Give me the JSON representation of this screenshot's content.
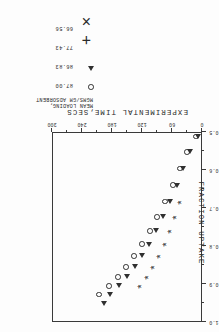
{
  "chart_data": {
    "type": "scatter",
    "title": "",
    "xlabel": "EXPERIMENTAL TIME,SECS",
    "ylabel": "FRACTION UPTAKE",
    "xlim": [
      0,
      300
    ],
    "ylim": [
      0.5,
      1.0
    ],
    "xticks": [
      "0",
      "60",
      "120",
      "180",
      "240",
      "300"
    ],
    "yticks": [
      "0.5",
      "0.6",
      "0.7",
      "0.8",
      "0.9",
      "1.0"
    ],
    "grid": false,
    "legend_position": "outside-right",
    "legend_title_line1": "MEAN LOADING,",
    "legend_title_line2": "MGMS/GM ADSORBENT",
    "series": [
      {
        "name": "87.00",
        "marker": "circle",
        "points": [
          {
            "x": 12,
            "y": 0.512
          },
          {
            "x": 30,
            "y": 0.552
          },
          {
            "x": 44,
            "y": 0.596
          },
          {
            "x": 58,
            "y": 0.64
          },
          {
            "x": 74,
            "y": 0.683
          },
          {
            "x": 90,
            "y": 0.723
          },
          {
            "x": 104,
            "y": 0.76
          },
          {
            "x": 120,
            "y": 0.795
          },
          {
            "x": 136,
            "y": 0.826
          },
          {
            "x": 152,
            "y": 0.855
          },
          {
            "x": 168,
            "y": 0.881
          },
          {
            "x": 186,
            "y": 0.905
          },
          {
            "x": 206,
            "y": 0.928
          }
        ]
      },
      {
        "name": "86.83",
        "marker": "triangle",
        "points": [
          {
            "x": 8,
            "y": 0.512
          },
          {
            "x": 24,
            "y": 0.552
          },
          {
            "x": 38,
            "y": 0.596
          },
          {
            "x": 50,
            "y": 0.64
          },
          {
            "x": 64,
            "y": 0.683
          },
          {
            "x": 78,
            "y": 0.723
          },
          {
            "x": 92,
            "y": 0.76
          },
          {
            "x": 106,
            "y": 0.795
          },
          {
            "x": 120,
            "y": 0.826
          },
          {
            "x": 134,
            "y": 0.855
          },
          {
            "x": 150,
            "y": 0.881
          },
          {
            "x": 166,
            "y": 0.905
          },
          {
            "x": 184,
            "y": 0.928
          },
          {
            "x": 196,
            "y": 0.952
          }
        ]
      },
      {
        "name": "77.43",
        "marker": "plus",
        "points": [
          {
            "x": 46,
            "y": 0.683
          },
          {
            "x": 56,
            "y": 0.723
          },
          {
            "x": 66,
            "y": 0.76
          },
          {
            "x": 76,
            "y": 0.795
          },
          {
            "x": 88,
            "y": 0.826
          },
          {
            "x": 100,
            "y": 0.855
          },
          {
            "x": 112,
            "y": 0.881
          },
          {
            "x": 126,
            "y": 0.905
          }
        ]
      },
      {
        "name": "66.56",
        "marker": "cross",
        "points": [
          {
            "x": 44,
            "y": 0.683
          },
          {
            "x": 54,
            "y": 0.723
          },
          {
            "x": 64,
            "y": 0.76
          },
          {
            "x": 74,
            "y": 0.795
          },
          {
            "x": 86,
            "y": 0.826
          },
          {
            "x": 98,
            "y": 0.855
          },
          {
            "x": 110,
            "y": 0.881
          },
          {
            "x": 124,
            "y": 0.905
          }
        ]
      }
    ]
  },
  "legend": {
    "title_line1": "MEAN LOADING,",
    "title_line2": "MGMS/GM ADSORBENT",
    "entries": [
      {
        "value": "87.00",
        "marker": "circle"
      },
      {
        "value": "86.83",
        "marker": "triangle"
      },
      {
        "value": "77.43",
        "marker": "plus"
      },
      {
        "value": "66.56",
        "marker": "cross"
      }
    ]
  },
  "axes": {
    "x_title": "EXPERIMENTAL TIME,SECS",
    "y_title": "FRACTION UPTAKE",
    "x_ticks": [
      "0",
      "60",
      "120",
      "180",
      "240",
      "300"
    ],
    "y_ticks": [
      "0.5",
      "0.6",
      "0.7",
      "0.8",
      "0.9",
      "1.0"
    ]
  },
  "colors": {
    "ink": "#303030",
    "paper": "#fdfdfd"
  }
}
